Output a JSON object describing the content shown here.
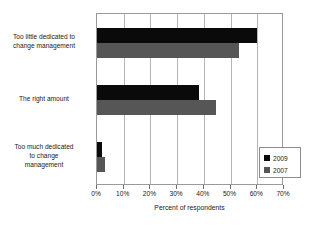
{
  "chart_data": {
    "type": "bar",
    "orientation": "horizontal",
    "title": "",
    "xlabel": "Percent of respondents",
    "ylabel": "",
    "xlim": [
      0,
      70
    ],
    "xtick_labels": [
      "0%",
      "10%",
      "20%",
      "30%",
      "40%",
      "50%",
      "60%",
      "70%"
    ],
    "xticks": [
      0,
      10,
      20,
      30,
      40,
      50,
      60,
      70
    ],
    "grid": true,
    "legend_position": "lower-right",
    "categories": [
      "Too little dedicated to change management",
      "The right amount",
      "Too much dedicated to change management"
    ],
    "category_lines": [
      [
        "Too little dedicated to",
        "change management"
      ],
      [
        "The right amount"
      ],
      [
        "Too much dedicated",
        "to change",
        "management"
      ]
    ],
    "series": [
      {
        "name": "2009",
        "color": "#0a0a0a",
        "values": [
          60,
          38,
          2
        ]
      },
      {
        "name": "2007",
        "color": "#565656",
        "values": [
          53,
          44.5,
          3
        ]
      }
    ]
  },
  "legend": {
    "entries": [
      {
        "label": "2009"
      },
      {
        "label": "2007"
      }
    ]
  },
  "colors": {
    "series_2009": "#0a0a0a",
    "series_2007": "#565656",
    "grid": "#b5b5b5",
    "border": "#9a9a9a",
    "text": "#1a1a1a",
    "background": "#ffffff"
  }
}
